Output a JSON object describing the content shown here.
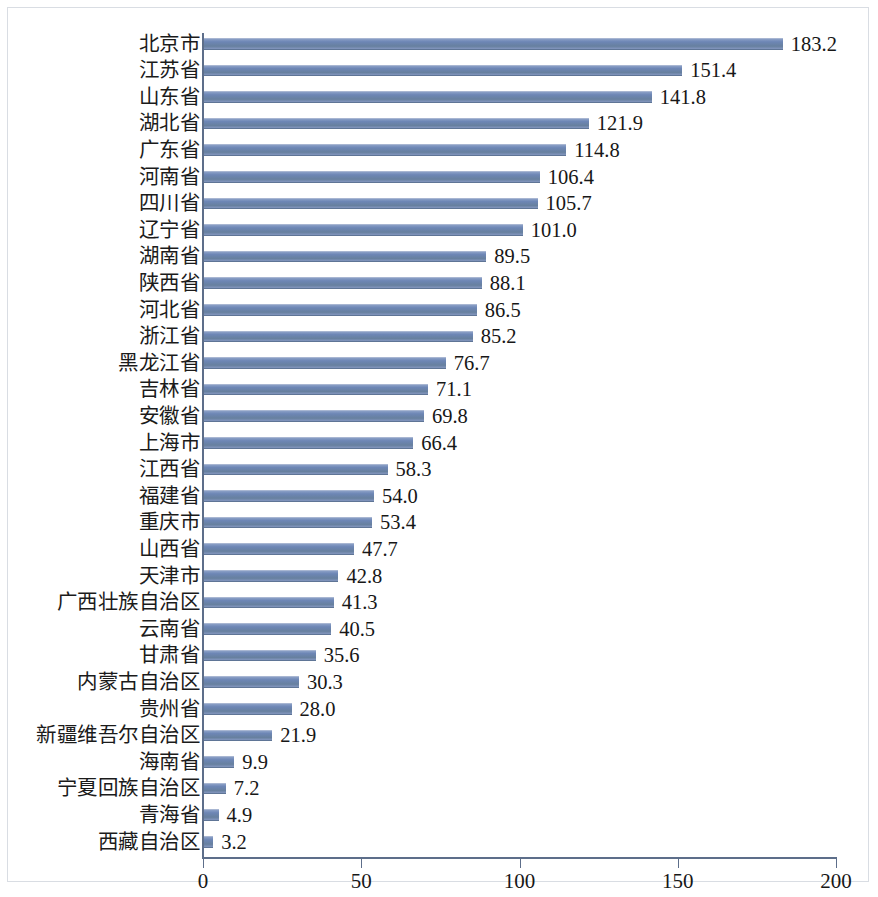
{
  "chart_data": {
    "type": "bar",
    "orientation": "horizontal",
    "title": "",
    "subtitle": "",
    "xlabel": "",
    "ylabel": "",
    "xlim": [
      0,
      200
    ],
    "xticks": [
      0,
      50,
      100,
      150,
      200
    ],
    "grid": false,
    "legend": null,
    "series_color": "#6d86b5",
    "value_label_format": "one-decimal",
    "categories": [
      "北京市",
      "江苏省",
      "山东省",
      "湖北省",
      "广东省",
      "河南省",
      "四川省",
      "辽宁省",
      "湖南省",
      "陕西省",
      "河北省",
      "浙江省",
      "黑龙江省",
      "吉林省",
      "安徽省",
      "上海市",
      "江西省",
      "福建省",
      "重庆市",
      "山西省",
      "天津市",
      "广西壮族自治区",
      "云南省",
      "甘肃省",
      "内蒙古自治区",
      "贵州省",
      "新疆维吾尔自治区",
      "海南省",
      "宁夏回族自治区",
      "青海省",
      "西藏自治区"
    ],
    "values": [
      183.2,
      151.4,
      141.8,
      121.9,
      114.8,
      106.4,
      105.7,
      101.0,
      89.5,
      88.1,
      86.5,
      85.2,
      76.7,
      71.1,
      69.8,
      66.4,
      58.3,
      54.0,
      53.4,
      47.7,
      42.8,
      41.3,
      40.5,
      35.6,
      30.3,
      28.0,
      21.9,
      9.9,
      7.2,
      4.9,
      3.2
    ],
    "value_labels": [
      "183.2",
      "151.4",
      "141.8",
      "121.9",
      "114.8",
      "106.4",
      "105.7",
      "101.0",
      "89.5",
      "88.1",
      "86.5",
      "85.2",
      "76.7",
      "71.1",
      "69.8",
      "66.4",
      "58.3",
      "54.0",
      "53.4",
      "47.7",
      "42.8",
      "41.3",
      "40.5",
      "35.6",
      "30.3",
      "28.0",
      "21.9",
      "9.9",
      "7.2",
      "4.9",
      "3.2"
    ],
    "xtick_labels": [
      "0",
      "50",
      "100",
      "150",
      "200"
    ]
  }
}
